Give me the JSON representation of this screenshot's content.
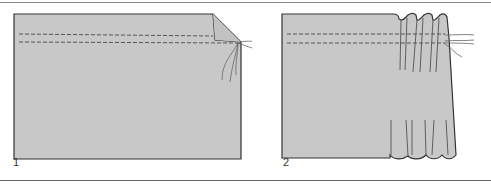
{
  "figure": {
    "panels": [
      {
        "label": "1",
        "description": "Fabric rectangle with two rows of gathering stitches along top edge, corner folded, thread ends loose"
      },
      {
        "label": "2",
        "description": "Threads pulled to gather fabric, forming pleats on right side"
      }
    ],
    "colors": {
      "fabric_fill": "#c8c8c8",
      "outline": "#333333",
      "stitch": "#555555",
      "thread": "#666666",
      "rule": "#666666"
    }
  }
}
